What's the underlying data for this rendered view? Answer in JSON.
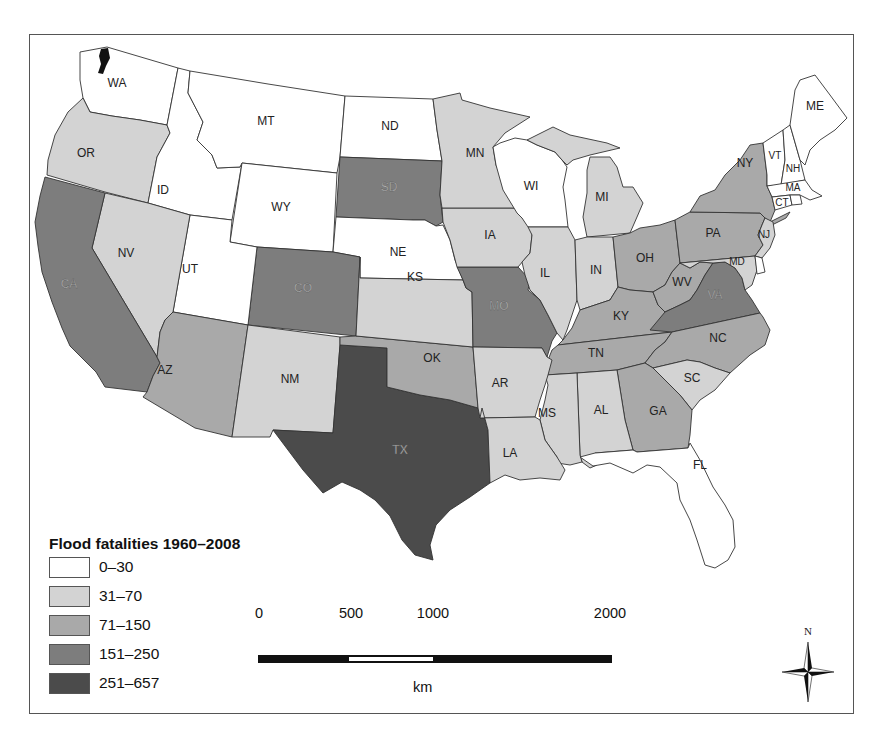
{
  "map": {
    "legend": {
      "title": "Flood fatalities 1960–2008",
      "bins": [
        {
          "label": "0–30",
          "color": "#ffffff"
        },
        {
          "label": "31–70",
          "color": "#d3d3d3"
        },
        {
          "label": "71–150",
          "color": "#a9a9a9"
        },
        {
          "label": "151–250",
          "color": "#7d7d7d"
        },
        {
          "label": "251–657",
          "color": "#4b4b4b"
        }
      ]
    },
    "states": {
      "WA": {
        "label": "WA",
        "bin": 0
      },
      "OR": {
        "label": "OR",
        "bin": 1
      },
      "ID": {
        "label": "ID",
        "bin": 0
      },
      "MT": {
        "label": "MT",
        "bin": 0
      },
      "WY": {
        "label": "WY",
        "bin": 0
      },
      "ND": {
        "label": "ND",
        "bin": 0
      },
      "SD": {
        "label": "SD",
        "bin": 3
      },
      "NE": {
        "label": "NE",
        "bin": 0
      },
      "CO": {
        "label": "CO",
        "bin": 3
      },
      "UT": {
        "label": "UT",
        "bin": 0
      },
      "NV": {
        "label": "NV",
        "bin": 1
      },
      "CA": {
        "label": "CA",
        "bin": 3
      },
      "AZ": {
        "label": "AZ",
        "bin": 2
      },
      "NM": {
        "label": "NM",
        "bin": 1
      },
      "TX": {
        "label": "TX",
        "bin": 4
      },
      "OK": {
        "label": "OK",
        "bin": 2
      },
      "KS": {
        "label": "KS",
        "bin": 1
      },
      "MO": {
        "label": "MO",
        "bin": 3
      },
      "IA": {
        "label": "IA",
        "bin": 1
      },
      "MN": {
        "label": "MN",
        "bin": 1
      },
      "WI": {
        "label": "WI",
        "bin": 0
      },
      "MI": {
        "label": "MI",
        "bin": 1
      },
      "IL": {
        "label": "IL",
        "bin": 1
      },
      "IN": {
        "label": "IN",
        "bin": 1
      },
      "OH": {
        "label": "OH",
        "bin": 2
      },
      "KY": {
        "label": "KY",
        "bin": 2
      },
      "TN": {
        "label": "TN",
        "bin": 2
      },
      "VA": {
        "label": "VA",
        "bin": 3
      },
      "WV": {
        "label": "WV",
        "bin": 2
      },
      "PA": {
        "label": "PA",
        "bin": 2
      },
      "NY": {
        "label": "NY",
        "bin": 2
      },
      "NJ": {
        "label": "NJ",
        "bin": 1
      },
      "MD": {
        "label": "MD",
        "bin": 1
      },
      "DE": {
        "label": "",
        "bin": 0
      },
      "VT": {
        "label": "VT",
        "bin": 0
      },
      "NH": {
        "label": "NH",
        "bin": 0
      },
      "ME": {
        "label": "ME",
        "bin": 0
      },
      "MA": {
        "label": "MA",
        "bin": 0
      },
      "CT": {
        "label": "CT",
        "bin": 0
      },
      "RI": {
        "label": "",
        "bin": 0
      },
      "NC": {
        "label": "NC",
        "bin": 2
      },
      "SC": {
        "label": "SC",
        "bin": 1
      },
      "GA": {
        "label": "GA",
        "bin": 2
      },
      "AL": {
        "label": "AL",
        "bin": 1
      },
      "MS": {
        "label": "MS",
        "bin": 1
      },
      "AR": {
        "label": "AR",
        "bin": 1
      },
      "LA": {
        "label": "LA",
        "bin": 1
      },
      "FL": {
        "label": "FL",
        "bin": 0
      }
    }
  },
  "scale_bar": {
    "ticks": [
      "0",
      "500",
      "1000",
      "2000"
    ],
    "unit": "km"
  },
  "north_arrow": {
    "label": "N"
  }
}
